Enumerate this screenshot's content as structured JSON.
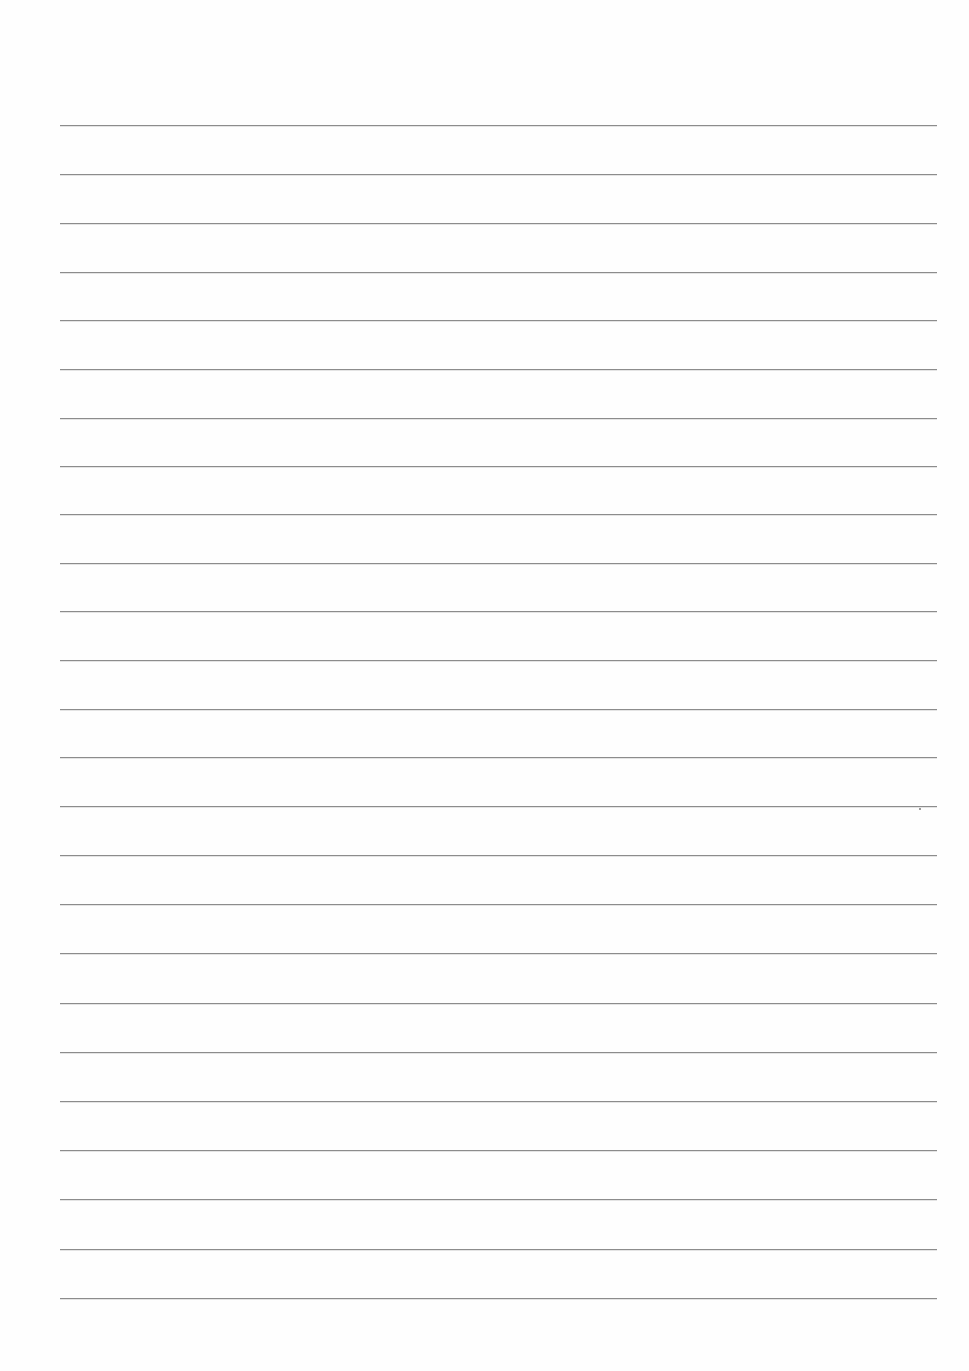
{
  "document": {
    "type": "lined-paper",
    "background_color": "#fefefe",
    "rule_color": "#8c8c8c",
    "rule_count": 25,
    "rule_left": 60,
    "rule_width": 877,
    "rules_y": [
      125,
      174,
      223,
      272,
      320,
      369,
      418,
      466,
      514,
      563,
      611,
      660,
      709,
      757,
      806,
      855,
      904,
      953,
      1003,
      1052,
      1101,
      1150,
      1199,
      1249,
      1298
    ],
    "text_content": []
  }
}
